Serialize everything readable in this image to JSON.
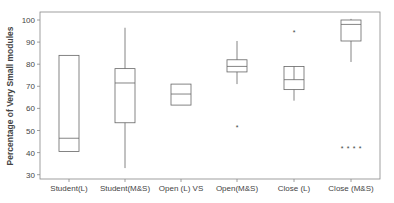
{
  "chart_data": {
    "type": "boxplot",
    "title": "",
    "xlabel": "",
    "ylabel": "Percentage of Very Small modules",
    "ylim": [
      28,
      103
    ],
    "yticks": [
      30,
      40,
      50,
      60,
      70,
      80,
      90,
      100
    ],
    "grid": false,
    "legend": null,
    "categories": [
      "Student(L)",
      "Student(M&S)",
      "Open (L) VS",
      "Open(M&S)",
      "Close (L)",
      "Close (M&S)"
    ],
    "boxes": [
      {
        "category": "Student(L)",
        "whisker_low": 40.5,
        "q1": 40.5,
        "median": 46.5,
        "q3": 84,
        "whisker_high": 84,
        "outliers": []
      },
      {
        "category": "Student(M&S)",
        "whisker_low": 33,
        "q1": 53.5,
        "median": 71.5,
        "q3": 78,
        "whisker_high": 96.5,
        "outliers": []
      },
      {
        "category": "Open (L) VS",
        "whisker_low": 61.5,
        "q1": 61.5,
        "median": 66.5,
        "q3": 71,
        "whisker_high": 71,
        "outliers": []
      },
      {
        "category": "Open(M&S)",
        "whisker_low": 71,
        "q1": 76.5,
        "median": 79,
        "q3": 82,
        "whisker_high": 90.5,
        "outliers": [
          51.5
        ]
      },
      {
        "category": "Close (L)",
        "whisker_low": 63.5,
        "q1": 68.5,
        "median": 73,
        "q3": 79,
        "whisker_high": 79,
        "outliers": [
          94.5
        ]
      },
      {
        "category": "Close (M&S)",
        "whisker_low": 81,
        "q1": 90.5,
        "median": 98,
        "q3": 100,
        "whisker_high": 100.5,
        "outliers": [
          42,
          42,
          42,
          42
        ]
      }
    ]
  },
  "colors": {
    "line": "#666666",
    "text": "#444444",
    "background": "#ffffff"
  }
}
